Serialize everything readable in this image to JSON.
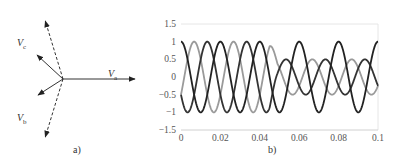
{
  "panel_a": {
    "caption": "a)",
    "phasors": [
      {
        "name": "Va",
        "main": "V",
        "sub": "a",
        "solid": true,
        "angle_deg": 0,
        "length": 72,
        "dashed_length": 0
      },
      {
        "name": "Vb",
        "main": "V",
        "sub": "b",
        "solid": true,
        "angle_deg": -120,
        "length": 30,
        "dashed_length": 77
      },
      {
        "name": "Vc",
        "main": "V",
        "sub": "c",
        "solid": true,
        "angle_deg": 120,
        "length": 38,
        "dashed_length": 77
      }
    ]
  },
  "panel_b": {
    "caption": "b)"
  },
  "chart_data": {
    "type": "line",
    "title": "",
    "xlabel": "",
    "ylabel": "",
    "xlim": [
      0,
      0.1
    ],
    "ylim": [
      -1.5,
      1.5
    ],
    "x_ticks": [
      "0",
      "0.02",
      "0.04",
      "0.06",
      "0.08",
      "0.1"
    ],
    "y_ticks": [
      "1.5",
      "1",
      "0.5",
      "0",
      "-0.5",
      "-1",
      "-1.5"
    ],
    "grid": false,
    "frequency_hz": 50,
    "fault_time_s": 0.045,
    "series": [
      {
        "name": "phase a",
        "color": "#222222",
        "amplitude_before": 1.0,
        "amplitude_after": 1.0,
        "phase_deg": 0
      },
      {
        "name": "phase b",
        "color": "#9a9a9a",
        "amplitude_before": 1.0,
        "amplitude_after": 0.5,
        "phase_deg": -120
      },
      {
        "name": "phase c",
        "color": "#333333",
        "amplitude_before": 1.0,
        "amplitude_after": 0.5,
        "phase_deg": 120
      }
    ]
  }
}
